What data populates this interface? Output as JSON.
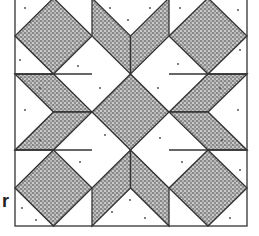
{
  "figure": {
    "type": "quilt-block-pattern",
    "grid": "3x3 nine-patch",
    "fill_pattern": "stippled-dots",
    "colors": {
      "outline": "#333333",
      "shaded": "#8a8a8a",
      "background": "#ffffff"
    },
    "cells": {
      "corners": "shaded diamond on point",
      "center": "shaded diamond on point",
      "edges": "shaded chevron (two parallelograms) pointing to center"
    }
  },
  "side_label": "r"
}
